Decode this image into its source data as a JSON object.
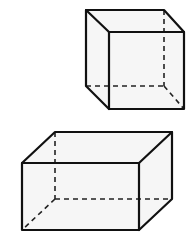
{
  "diagram": {
    "colors": {
      "edge": "#111111",
      "hidden_edge": "#222222",
      "face": "#f6f6f6",
      "background": "#ffffff"
    },
    "shapes": [
      {
        "name": "cube",
        "position": "top-right",
        "vertices": {
          "back_top_left": [
            86,
            10
          ],
          "back_top_right": [
            164,
            10
          ],
          "front_top_left": [
            109,
            32
          ],
          "front_top_right": [
            184,
            32
          ],
          "front_bottom_left": [
            109,
            109
          ],
          "front_bottom_right": [
            184,
            109
          ],
          "back_bottom_left": [
            86,
            86
          ],
          "back_bottom_right": [
            164,
            86
          ]
        },
        "hidden_vertex": "back_bottom_right"
      },
      {
        "name": "rectangular-prism",
        "position": "bottom-left",
        "vertices": {
          "back_top_left": [
            55,
            132
          ],
          "back_top_right": [
            172,
            132
          ],
          "front_top_left": [
            22,
            163
          ],
          "front_top_right": [
            139,
            163
          ],
          "front_bottom_left": [
            22,
            230
          ],
          "front_bottom_right": [
            139,
            230
          ],
          "back_bottom_left": [
            55,
            199
          ],
          "back_bottom_right": [
            172,
            199
          ]
        },
        "hidden_vertex": "back_bottom_left"
      }
    ]
  }
}
